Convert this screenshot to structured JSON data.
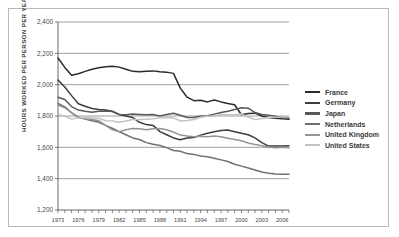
{
  "figure": {
    "frame_border_color": "#b9b9b9",
    "background": "#ffffff",
    "axis_color": "#555555",
    "gridline_color": "#777777"
  },
  "legend": {
    "position": "right",
    "entries": [
      {
        "label": "France",
        "color": "#2b2b2b"
      },
      {
        "label": "Germany",
        "color": "#3d3d3d"
      },
      {
        "label": "Japan",
        "color": "#585858"
      },
      {
        "label": "Netherlands",
        "color": "#6f6f6f"
      },
      {
        "label": "United Kingdom",
        "color": "#949494"
      },
      {
        "label": "United States",
        "color": "#c2c2c2"
      }
    ]
  },
  "chart_data": {
    "type": "line",
    "title": "",
    "xlabel": "",
    "ylabel": "HOURS WORKED PER PERSON PER YEAR",
    "ylim": [
      1200,
      2400
    ],
    "yticks": [
      1200,
      1400,
      1600,
      1800,
      2000,
      2200,
      2400
    ],
    "ytick_labels": [
      "1,200",
      "1,400",
      "1,600",
      "1,800",
      "2,000",
      "2,200",
      "2,400"
    ],
    "xlim": [
      1973,
      2007
    ],
    "xticks": [
      1973,
      1976,
      1979,
      1982,
      1985,
      1988,
      1991,
      1994,
      1997,
      2000,
      2003,
      2006
    ],
    "xtick_labels": [
      "1973",
      "1976",
      "1979",
      "1982",
      "1985",
      "1988",
      "1991",
      "1994",
      "1997",
      "2000",
      "2003",
      "2006"
    ],
    "minor_xticks_every": 1,
    "grid": "horizontal",
    "x": [
      1973,
      1974,
      1975,
      1976,
      1977,
      1978,
      1979,
      1980,
      1981,
      1982,
      1983,
      1984,
      1985,
      1986,
      1987,
      1988,
      1989,
      1990,
      1991,
      1992,
      1993,
      1994,
      1995,
      1996,
      1997,
      1998,
      1999,
      2000,
      2001,
      2002,
      2003,
      2004,
      2005,
      2006,
      2007
    ],
    "series": [
      {
        "name": "France",
        "color": "#2b2b2b",
        "values": [
          2170,
          2110,
          2060,
          2070,
          2085,
          2098,
          2108,
          2115,
          2118,
          2112,
          2098,
          2085,
          2082,
          2085,
          2088,
          2082,
          2080,
          2072,
          1978,
          1920,
          1898,
          1900,
          1890,
          1902,
          1890,
          1880,
          1872,
          1808,
          1816,
          1818,
          1800,
          1790,
          1785,
          1782,
          1780
        ]
      },
      {
        "name": "Germany",
        "color": "#3d3d3d",
        "values": [
          2030,
          1985,
          1930,
          1878,
          1862,
          1848,
          1842,
          1838,
          1830,
          1810,
          1800,
          1790,
          1760,
          1745,
          1740,
          1700,
          1680,
          1660,
          1648,
          1660,
          1662,
          1678,
          1690,
          1700,
          1708,
          1710,
          1700,
          1690,
          1680,
          1660,
          1630,
          1608,
          1608,
          1608,
          1610
        ]
      },
      {
        "name": "Japan",
        "color": "#585858",
        "values": [
          1920,
          1905,
          1860,
          1838,
          1830,
          1824,
          1830,
          1832,
          1828,
          1810,
          1808,
          1812,
          1810,
          1808,
          1810,
          1800,
          1810,
          1818,
          1805,
          1790,
          1790,
          1800,
          1802,
          1812,
          1822,
          1830,
          1842,
          1852,
          1850,
          1822,
          1810,
          1805,
          1798,
          1790,
          1785
        ]
      },
      {
        "name": "Netherlands",
        "color": "#6f6f6f",
        "values": [
          1880,
          1858,
          1820,
          1792,
          1780,
          1770,
          1760,
          1740,
          1722,
          1700,
          1680,
          1660,
          1650,
          1630,
          1620,
          1612,
          1598,
          1580,
          1575,
          1560,
          1555,
          1545,
          1540,
          1530,
          1520,
          1510,
          1492,
          1480,
          1468,
          1455,
          1442,
          1435,
          1430,
          1428,
          1428
        ]
      },
      {
        "name": "United Kingdom",
        "color": "#949494"
      },
      {
        "name": "United States",
        "color": "#c2c2c2",
        "values": [
          1810,
          1798,
          1780,
          1788,
          1790,
          1788,
          1786,
          1770,
          1768,
          1760,
          1768,
          1778,
          1778,
          1780,
          1782,
          1788,
          1790,
          1788,
          1768,
          1772,
          1778,
          1792,
          1798,
          1800,
          1810,
          1808,
          1808,
          1812,
          1792,
          1778,
          1784,
          1790,
          1792,
          1794,
          1795
        ]
      }
    ]
  },
  "chart_extra": {
    "uk_values": [
      1870,
      1852,
      1822,
      1790,
      1782,
      1778,
      1770,
      1740,
      1712,
      1700,
      1712,
      1720,
      1718,
      1712,
      1718,
      1720,
      1712,
      1698,
      1678,
      1672,
      1668,
      1670,
      1668,
      1672,
      1668,
      1658,
      1650,
      1642,
      1628,
      1618,
      1610,
      1602,
      1598,
      1600,
      1598
    ]
  }
}
